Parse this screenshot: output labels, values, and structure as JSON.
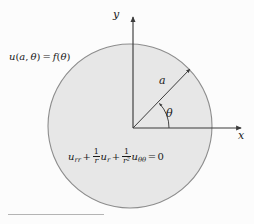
{
  "figure": {
    "background_color": "#fcfcfc",
    "disk": {
      "fill_color": "#e7e7e7",
      "stroke_color": "#8d8d8d",
      "center_x": 130,
      "center_y": 126,
      "radius": 82
    },
    "axes": {
      "origin_x": 133,
      "origin_y": 128,
      "stroke_color": "#3b3b3b",
      "x_label": "x",
      "y_label": "y"
    },
    "radius_arrow": {
      "label": "a",
      "angle_degrees": 45,
      "stroke_color": "#3b3b3b"
    },
    "angle_arc": {
      "label": "θ",
      "stroke_color": "#3b3b3b",
      "sweep_degrees": 45
    },
    "boundary_condition": {
      "u": "u",
      "open_paren": "(",
      "a": "a",
      "comma": ", ",
      "theta": "θ",
      "close_paren": ")",
      "equals": " = ",
      "f": "f",
      "f_open": "(",
      "f_theta": "θ",
      "f_close": ")"
    },
    "pde": {
      "term1_u": "u",
      "term1_sub": "rr",
      "plus1": "+",
      "frac1_num": "1",
      "frac1_den": "r",
      "term2_u": "u",
      "term2_sub": "r",
      "plus2": "+",
      "frac2_num": "1",
      "frac2_den": "r",
      "frac2_den_exp": "2",
      "term3_u": "u",
      "term3_sub": "θθ",
      "equals": "=",
      "zero": "0"
    },
    "caption_rule": {
      "color": "#b4b4b4"
    }
  }
}
